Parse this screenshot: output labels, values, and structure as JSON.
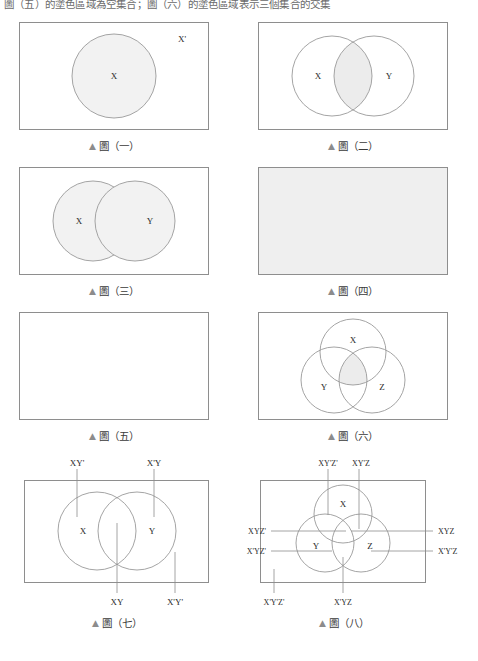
{
  "page": {
    "top_text": "圖（五）的塗色區域為空集合；圖（六）的塗色區域表示三個集合的交集",
    "width": 478,
    "height": 661,
    "colors": {
      "shade": "#ececec",
      "stroke": "#9a9a9a",
      "box_stroke": "#8e8e8e",
      "text": "#2b2b2b",
      "caption": "#3a3a3a",
      "triangle": "#8c8c8c",
      "background": "#ffffff"
    }
  },
  "figures": [
    {
      "id": "fig-1",
      "caption": "圖（一）",
      "caption_marker": "▲",
      "description": "rectangle-with-one-shaded-circle",
      "set_labels": [
        "X",
        "X'"
      ],
      "circles": [
        {
          "label": "X",
          "shaded": true
        },
        {
          "label": "X'",
          "shaded": false,
          "is_complement_region": true
        }
      ]
    },
    {
      "id": "fig-2",
      "caption": "圖（二）",
      "caption_marker": "▲",
      "description": "two-circles-intersection-shaded",
      "set_labels": [
        "X",
        "Y"
      ],
      "shaded_region": "intersection"
    },
    {
      "id": "fig-3",
      "caption": "圖（三）",
      "caption_marker": "▲",
      "description": "two-circles-union-shaded",
      "set_labels": [
        "X",
        "Y"
      ],
      "shaded_region": "union"
    },
    {
      "id": "fig-4",
      "caption": "圖（四）",
      "caption_marker": "▲",
      "description": "fully-shaded-rectangle",
      "set_labels": [],
      "shaded_region": "universal"
    },
    {
      "id": "fig-5",
      "caption": "圖（五）",
      "caption_marker": "▲",
      "description": "empty-rectangle",
      "set_labels": [],
      "shaded_region": "none"
    },
    {
      "id": "fig-6",
      "caption": "圖（六）",
      "caption_marker": "▲",
      "description": "three-circles-center-intersection-shaded",
      "set_labels": [
        "X",
        "Y",
        "Z"
      ],
      "shaded_region": "triple-intersection"
    },
    {
      "id": "fig-7",
      "caption": "圖（七）",
      "caption_marker": "▲",
      "description": "two-circles-four-regions-labelled",
      "set_labels": [
        "X",
        "Y"
      ],
      "region_labels": {
        "top_left": "XY'",
        "top_right": "X'Y",
        "bottom_left": "XY",
        "bottom_right": "X'Y'"
      }
    },
    {
      "id": "fig-8",
      "caption": "圖（八）",
      "caption_marker": "▲",
      "description": "three-circles-eight-regions-labelled",
      "set_labels": [
        "X",
        "Y",
        "Z"
      ],
      "region_labels": {
        "top_left": "XY'Z'",
        "top_right": "XY'Z",
        "left_upper": "XYZ'",
        "left_lower": "X'YZ'",
        "right_upper": "XYZ",
        "right_lower": "X'Y'Z",
        "bottom_left": "X'Y'Z'",
        "bottom_center": "X'YZ"
      }
    }
  ]
}
